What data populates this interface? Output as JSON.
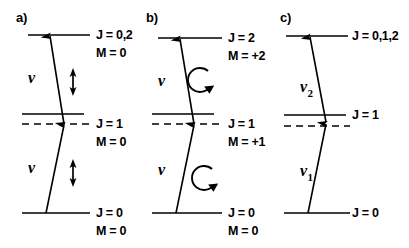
{
  "figure": {
    "caption_absent": true,
    "background_color": "#ffffff",
    "ink_color": "#000000",
    "panels": [
      {
        "id": "a",
        "label": "a)",
        "label_x": 16,
        "label_y": 22,
        "levels": [
          {
            "name": "upper",
            "style": "solid",
            "x1": 28,
            "x2": 90,
            "y": 35,
            "labels": [
              {
                "text": "J = 0,2",
                "x": 96,
                "y": 39
              },
              {
                "text": "M = 0",
                "x": 96,
                "y": 57
              }
            ]
          },
          {
            "name": "intermediate-real",
            "style": "solid",
            "x1": 22,
            "x2": 84,
            "y": 114,
            "labels": []
          },
          {
            "name": "intermediate-virtual",
            "style": "dashed",
            "x1": 22,
            "x2": 90,
            "y": 124,
            "labels": [
              {
                "text": "J = 1",
                "x": 96,
                "y": 128
              },
              {
                "text": "M = 0",
                "x": 96,
                "y": 146
              }
            ]
          },
          {
            "name": "ground",
            "style": "solid",
            "x1": 22,
            "x2": 90,
            "y": 213,
            "labels": [
              {
                "text": "J = 0",
                "x": 96,
                "y": 217
              },
              {
                "text": "M = 0",
                "x": 96,
                "y": 235
              }
            ]
          }
        ],
        "transitions": [
          {
            "name": "upper-photon",
            "x1": 64,
            "y1": 124,
            "x2": 50,
            "y2": 36,
            "arrow_at": "end",
            "photon_label": {
              "text": "ν",
              "subscript": "",
              "x": 28,
              "y": 83
            }
          },
          {
            "name": "lower-photon",
            "x1": 46,
            "y1": 213,
            "x2": 64,
            "y2": 125,
            "arrow_at": "end",
            "photon_label": {
              "text": "ν",
              "subscript": "",
              "x": 28,
              "y": 173
            }
          }
        ],
        "polarizations": [
          {
            "type": "linear",
            "x": 73,
            "y_top": 68,
            "y_bottom": 96
          },
          {
            "type": "linear",
            "x": 73,
            "y_top": 159,
            "y_bottom": 187
          }
        ]
      },
      {
        "id": "b",
        "label": "b)",
        "label_x": 146,
        "label_y": 22,
        "levels": [
          {
            "name": "upper",
            "style": "solid",
            "x1": 158,
            "x2": 222,
            "y": 38,
            "labels": [
              {
                "text": "J = 2",
                "x": 228,
                "y": 42
              },
              {
                "text": "M = +2",
                "x": 228,
                "y": 60
              }
            ]
          },
          {
            "name": "intermediate-real",
            "style": "solid",
            "x1": 152,
            "x2": 214,
            "y": 114,
            "labels": []
          },
          {
            "name": "intermediate-virtual",
            "style": "dashed",
            "x1": 152,
            "x2": 222,
            "y": 124,
            "labels": [
              {
                "text": "J = 1",
                "x": 228,
                "y": 128
              },
              {
                "text": "M = +1",
                "x": 228,
                "y": 146
              }
            ]
          },
          {
            "name": "ground",
            "style": "solid",
            "x1": 152,
            "x2": 222,
            "y": 213,
            "labels": [
              {
                "text": "J = 0",
                "x": 228,
                "y": 217
              },
              {
                "text": "M = 0",
                "x": 228,
                "y": 235
              }
            ]
          }
        ],
        "transitions": [
          {
            "name": "upper-photon",
            "x1": 194,
            "y1": 124,
            "x2": 180,
            "y2": 39,
            "arrow_at": "end",
            "photon_label": {
              "text": "ν",
              "subscript": "",
              "x": 158,
              "y": 86
            }
          },
          {
            "name": "lower-photon",
            "x1": 176,
            "y1": 213,
            "x2": 194,
            "y2": 125,
            "arrow_at": "end",
            "photon_label": {
              "text": "ν",
              "subscript": "",
              "x": 158,
              "y": 175
            }
          }
        ],
        "polarizations": [
          {
            "type": "circular",
            "cx": 200,
            "cy": 80,
            "r": 12,
            "direction": "clockwise"
          },
          {
            "type": "circular",
            "cx": 204,
            "cy": 178,
            "r": 12,
            "direction": "clockwise"
          }
        ]
      },
      {
        "id": "c",
        "label": "c)",
        "label_x": 280,
        "label_y": 22,
        "levels": [
          {
            "name": "upper",
            "style": "solid",
            "x1": 286,
            "x2": 348,
            "y": 36,
            "labels": [
              {
                "text": "J = 0,1,2",
                "x": 352,
                "y": 40
              }
            ]
          },
          {
            "name": "intermediate-real",
            "style": "solid",
            "x1": 284,
            "x2": 346,
            "y": 115,
            "labels": [
              {
                "text": "J = 1",
                "x": 352,
                "y": 119
              }
            ]
          },
          {
            "name": "intermediate-virtual",
            "style": "dashed",
            "x1": 284,
            "x2": 350,
            "y": 126,
            "labels": []
          },
          {
            "name": "ground",
            "style": "solid",
            "x1": 284,
            "x2": 350,
            "y": 213,
            "labels": [
              {
                "text": "J = 0",
                "x": 352,
                "y": 217
              }
            ]
          }
        ],
        "transitions": [
          {
            "name": "upper-photon",
            "x1": 326,
            "y1": 122,
            "x2": 310,
            "y2": 37,
            "arrow_at": "end",
            "photon_label": {
              "text": "ν",
              "subscript": "2",
              "x": 300,
              "y": 92
            }
          },
          {
            "name": "lower-photon",
            "x1": 308,
            "y1": 213,
            "x2": 326,
            "y2": 124,
            "arrow_at": "end",
            "photon_label": {
              "text": "ν",
              "subscript": "1",
              "x": 300,
              "y": 176
            }
          }
        ],
        "polarizations": []
      }
    ]
  }
}
